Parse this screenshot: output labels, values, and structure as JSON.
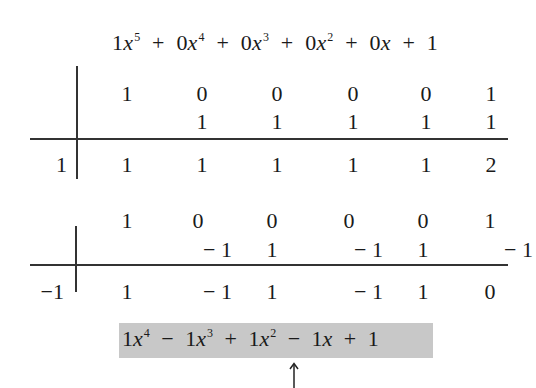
{
  "dividend": {
    "terms": [
      {
        "coef": "1",
        "var": "x",
        "exp": "5"
      },
      {
        "op": "+",
        "coef": "0",
        "var": "x",
        "exp": "4"
      },
      {
        "op": "+",
        "coef": "0",
        "var": "x",
        "exp": "3"
      },
      {
        "op": "+",
        "coef": "0",
        "var": "x",
        "exp": "2"
      },
      {
        "op": "+",
        "coef": "0",
        "var": "x",
        "exp": ""
      },
      {
        "op": "+",
        "coef": "1",
        "var": "",
        "exp": ""
      }
    ]
  },
  "division1": {
    "divisor": "1",
    "coefficients": [
      "1",
      "0",
      "0",
      "0",
      "0",
      "1"
    ],
    "products": [
      "",
      "1",
      "1",
      "1",
      "1",
      "1"
    ],
    "results": [
      "1",
      "1",
      "1",
      "1",
      "1",
      "2"
    ]
  },
  "division2": {
    "divisor": "−1",
    "coefficients": [
      "1",
      "0",
      "0",
      "0",
      "0",
      "1"
    ],
    "products": [
      "",
      "− 1",
      "1",
      "− 1",
      "1",
      "− 1"
    ],
    "results": [
      "1",
      "− 1",
      "1",
      "− 1",
      "1",
      "0"
    ]
  },
  "quotient": {
    "terms": [
      {
        "coef": "1",
        "var": "x",
        "exp": "4"
      },
      {
        "op": "−",
        "coef": "1",
        "var": "x",
        "exp": "3"
      },
      {
        "op": "+",
        "coef": "1",
        "var": "x",
        "exp": "2"
      },
      {
        "op": "−",
        "coef": "1",
        "var": "x",
        "exp": ""
      },
      {
        "op": "+",
        "coef": "1",
        "var": "",
        "exp": ""
      }
    ],
    "highlight_color": "#c8c8c8"
  },
  "annotations": {
    "arrow": "up-arrow"
  }
}
